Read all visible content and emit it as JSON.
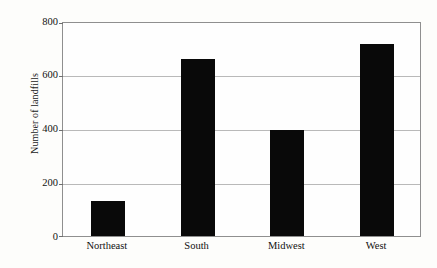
{
  "chart_data": {
    "type": "bar",
    "title": "",
    "xlabel": "",
    "ylabel": "Number of landfills",
    "categories": [
      "Northeast",
      "South",
      "Midwest",
      "West"
    ],
    "values": [
      130,
      665,
      400,
      720
    ],
    "ylim": [
      0,
      800
    ],
    "yticks": [
      0,
      200,
      400,
      600,
      800
    ],
    "ytick_labels": [
      "0",
      "200",
      "400",
      "600",
      "800"
    ],
    "grid": true,
    "legend": "none",
    "bar_color": "#090909",
    "frame_color": "#8f8f8f",
    "gridline_color": "#b9b9b9",
    "background_color": "#fdfdfb"
  }
}
